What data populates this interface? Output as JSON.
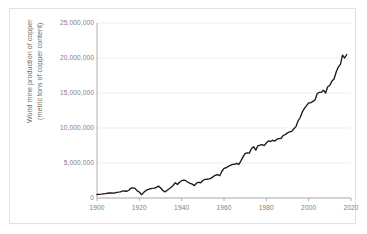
{
  "chart_data": {
    "type": "line",
    "title": "",
    "xlabel": "",
    "ylabel": "World mine production of copper (metric tons of copper content)",
    "ylabel_line1": "World mine production of copper",
    "ylabel_line2": "(metric tons of copper content)",
    "xlim": [
      1900,
      2020
    ],
    "ylim": [
      0,
      25000000
    ],
    "grid": true,
    "grid_axis": "y",
    "legend": false,
    "line_color": "#1a1a1a",
    "grid_color": "#e8e8e8",
    "axis_color": "#a6a6a6",
    "tick_text_color": "#808080",
    "background_color": "#ffffff",
    "border_color": "#e2e2e2",
    "yticks": [
      0,
      5000000,
      10000000,
      15000000,
      20000000,
      25000000
    ],
    "ytick_labels": [
      "0",
      "5,000,000",
      "10,000,000",
      "15,000,000",
      "20,000,000",
      "25,000,000"
    ],
    "xticks": [
      1900,
      1920,
      1940,
      1960,
      1980,
      2000,
      2020
    ],
    "xtick_labels": [
      "1900",
      "1920",
      "1940",
      "1960",
      "1980",
      "2000",
      "2020"
    ],
    "series": [
      {
        "name": "World mine production of copper",
        "x": [
          1900,
          1901,
          1902,
          1903,
          1904,
          1905,
          1906,
          1907,
          1908,
          1909,
          1910,
          1911,
          1912,
          1913,
          1914,
          1915,
          1916,
          1917,
          1918,
          1919,
          1920,
          1921,
          1922,
          1923,
          1924,
          1925,
          1926,
          1927,
          1928,
          1929,
          1930,
          1931,
          1932,
          1933,
          1934,
          1935,
          1936,
          1937,
          1938,
          1939,
          1940,
          1941,
          1942,
          1943,
          1944,
          1945,
          1946,
          1947,
          1948,
          1949,
          1950,
          1951,
          1952,
          1953,
          1954,
          1955,
          1956,
          1957,
          1958,
          1959,
          1960,
          1961,
          1962,
          1963,
          1964,
          1965,
          1966,
          1967,
          1968,
          1969,
          1970,
          1971,
          1972,
          1973,
          1974,
          1975,
          1976,
          1977,
          1978,
          1979,
          1980,
          1981,
          1982,
          1983,
          1984,
          1985,
          1986,
          1987,
          1988,
          1989,
          1990,
          1991,
          1992,
          1993,
          1994,
          1995,
          1996,
          1997,
          1998,
          1999,
          2000,
          2001,
          2002,
          2003,
          2004,
          2005,
          2006,
          2007,
          2008,
          2009,
          2010,
          2011,
          2012,
          2013,
          2014,
          2015,
          2016,
          2017,
          2018
        ],
        "values": [
          495000,
          520000,
          545000,
          580000,
          620000,
          680000,
          715000,
          725000,
          700000,
          780000,
          850000,
          870000,
          975000,
          1000000,
          960000,
          1110000,
          1400000,
          1440000,
          1380000,
          1010000,
          860000,
          470000,
          770000,
          1040000,
          1190000,
          1290000,
          1380000,
          1410000,
          1500000,
          1700000,
          1470000,
          1110000,
          880000,
          1060000,
          1290000,
          1530000,
          1800000,
          2180000,
          1930000,
          2250000,
          2470000,
          2560000,
          2470000,
          2250000,
          2100000,
          1980000,
          1770000,
          2110000,
          2250000,
          2170000,
          2500000,
          2650000,
          2680000,
          2740000,
          2830000,
          3090000,
          3250000,
          3350000,
          3180000,
          3820000,
          4240000,
          4320000,
          4510000,
          4650000,
          4800000,
          4800000,
          4950000,
          4790000,
          5300000,
          5880000,
          6370000,
          6440000,
          6420000,
          7060000,
          7330000,
          6840000,
          7460000,
          7550000,
          7620000,
          7490000,
          7850000,
          8160000,
          8070000,
          8250000,
          8140000,
          8400000,
          8480000,
          8530000,
          8960000,
          9070000,
          9300000,
          9440000,
          9510000,
          9890000,
          10200000,
          11000000,
          11500000,
          12300000,
          12800000,
          13200000,
          13600000,
          13600000,
          13800000,
          14000000,
          14900000,
          15100000,
          15100000,
          15400000,
          15000000,
          15900000,
          16100000,
          16700000,
          17000000,
          18000000,
          18700000,
          19100000,
          20400000,
          20000000,
          20500000
        ]
      }
    ],
    "annotations": []
  }
}
